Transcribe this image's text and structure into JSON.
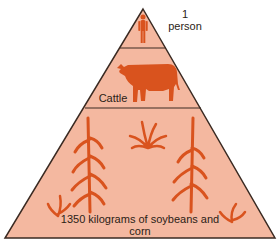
{
  "diagram": {
    "type": "food-pyramid",
    "colors": {
      "fill": "#f4b8a0",
      "organism": "#d9531e",
      "outline": "#3a2a22"
    },
    "levels": [
      {
        "id": "top",
        "label_line1": "1",
        "label_line2": "person",
        "icon": "person-icon"
      },
      {
        "id": "middle",
        "label": "Cattle",
        "icon": "cattle-icon"
      },
      {
        "id": "base",
        "label_line1": "1350 kilograms of soybeans and",
        "label_line2": "corn",
        "icon": "crops-icon"
      }
    ]
  }
}
